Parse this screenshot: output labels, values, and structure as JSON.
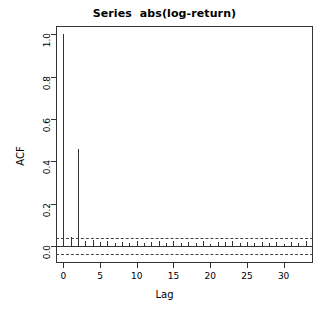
{
  "chart_data": {
    "type": "bar",
    "title": "Series  abs(log-return)",
    "xlabel": "Lag",
    "ylabel": "ACF",
    "grid": false,
    "legend": null,
    "xlim": [
      -1,
      34
    ],
    "ylim": [
      -0.08,
      1.04
    ],
    "xticks": [
      0,
      5,
      10,
      15,
      20,
      25,
      30
    ],
    "xtick_labels": [
      "0",
      "5",
      "10",
      "15",
      "20",
      "25",
      "30"
    ],
    "yticks": [
      0.0,
      0.2,
      0.4,
      0.6,
      0.8,
      1.0
    ],
    "ytick_labels": [
      "0.0",
      "0.2",
      "0.4",
      "0.6",
      "0.8",
      "1.0"
    ],
    "confidence_level": 0.95,
    "confidence_bounds": [
      -0.038,
      0.038
    ],
    "zero_line": 0.0,
    "categories": [
      0,
      1,
      2,
      3,
      4,
      5,
      6,
      7,
      8,
      9,
      10,
      11,
      12,
      13,
      14,
      15,
      16,
      17,
      18,
      19,
      20,
      21,
      22,
      23,
      24,
      25,
      26,
      27,
      28,
      29,
      30,
      31,
      32,
      33,
      34
    ],
    "values": [
      1.0,
      0.042,
      0.46,
      0.022,
      0.028,
      0.018,
      0.025,
      0.015,
      0.02,
      0.016,
      0.024,
      0.014,
      0.019,
      0.022,
      0.016,
      0.026,
      0.013,
      0.021,
      0.015,
      0.024,
      0.012,
      0.02,
      0.017,
      0.022,
      0.014,
      0.019,
      0.013,
      0.021,
      0.015,
      0.018,
      0.012,
      0.02,
      0.016,
      0.023,
      0.014
    ]
  },
  "chart": {
    "title": "Series  abs(log-return)",
    "xlabel": "Lag",
    "ylabel": "ACF"
  }
}
